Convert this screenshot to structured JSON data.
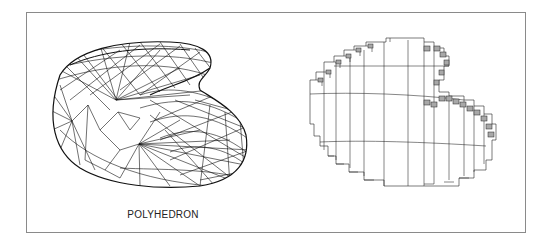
{
  "figure": {
    "panels": [
      {
        "id": "polyhedron",
        "label": "POLYHEDRON",
        "kind": "triangulated wireframe mesh"
      },
      {
        "id": "voxel",
        "label": "VOXEL MODEL",
        "kind": "voxelized cube approximation"
      }
    ],
    "colors": {
      "line": "#111111",
      "frame": "#8a8a8a",
      "background": "#ffffff",
      "voxel_shade": "#9a9a9a"
    }
  }
}
